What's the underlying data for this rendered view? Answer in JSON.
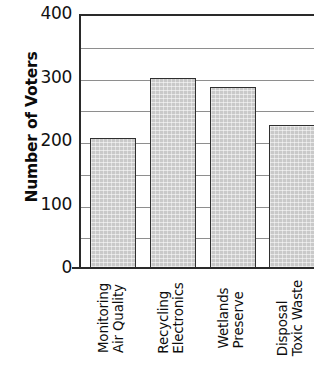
{
  "chart_data": {
    "type": "bar",
    "title": "",
    "xlabel": "",
    "ylabel": "Number of Voters",
    "categories": [
      "Air Quality Monitoring",
      "Electronics Recycling",
      "Preserve Wetlands",
      "Toxic Waste Disposal"
    ],
    "category_lines": [
      [
        "Air Quality",
        "Monitoring"
      ],
      [
        "Electronics",
        "Recycling"
      ],
      [
        "Preserve",
        "Wetlands"
      ],
      [
        "Toxic Waste",
        "Disposal"
      ]
    ],
    "values": [
      205,
      300,
      285,
      225
    ],
    "ylim": [
      0,
      400
    ],
    "y_major_ticks": [
      0,
      100,
      200,
      300,
      400
    ],
    "y_minor_ticks": [
      50,
      150,
      250,
      350
    ],
    "y_tick_labels": [
      "0",
      "100",
      "200",
      "300",
      "400"
    ],
    "grid": true,
    "grid_axis": "y",
    "legend": false,
    "bar_fill_color": "#c9c9c9",
    "bar_edge_color": "#2f2f2f",
    "axis_color": "#2a2a2a",
    "gridline_color": "#8e8e8e",
    "text_color": "#0d0d0d",
    "background_color": "#ffffff",
    "note": "Rightmost bar is clipped by the image edge"
  }
}
